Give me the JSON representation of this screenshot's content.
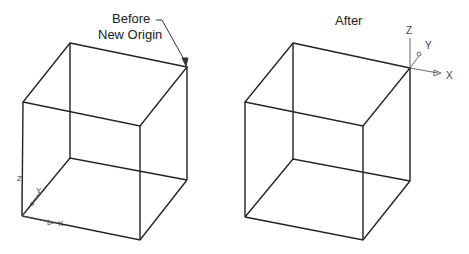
{
  "labels": {
    "before_line1": "Before",
    "before_line2": "New Origin",
    "after": "After"
  },
  "axes": {
    "x": "X",
    "y": "Y",
    "z": "Z"
  },
  "colors": {
    "line": "#222222",
    "axis": "#555555",
    "background": "#ffffff"
  }
}
